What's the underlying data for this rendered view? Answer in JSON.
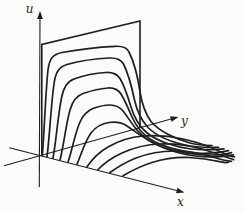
{
  "figure": {
    "description_label": "3D sketch of a solution surface u(x,y) drawn as a family of profile curves with a vertical boundary wall",
    "canvas": {
      "width": 245,
      "height": 213,
      "background": "#fbfbf9"
    },
    "ink_color": "#1f1f1f",
    "axes": {
      "u": {
        "label": "u",
        "x1": 39.3,
        "y1": 187,
        "x2": 40,
        "y2": 13,
        "tip_x": 40,
        "tip_y": 11,
        "tip_angle": -90,
        "label_x": 29.5,
        "label_y": 13
      },
      "y": {
        "label": "y",
        "x1": 4,
        "y1": 165.8,
        "x2": 175.5,
        "y2": 117.7,
        "tip_x": 178.5,
        "tip_y": 116.9,
        "tip_angle": -15.7,
        "label_x": 184.5,
        "label_y": 124.5
      },
      "x": {
        "label": "x",
        "x1": 9.3,
        "y1": 147.7,
        "x2": 181.5,
        "y2": 191.8,
        "tip_x": 184.5,
        "tip_y": 192.5,
        "tip_angle": 14.3,
        "label_x": 180.5,
        "label_y": 206
      }
    },
    "wall": {
      "name": "boundary-plane",
      "path": "M41.8,155 L41.8,44.5 L140,21 L140,127.6"
    },
    "curves": [
      {
        "name": "profile-1",
        "d": "M42.3,155.5 C44.5,130 45.5,92 48,70 C49.5,58 53,54.5 62,52.5 C78,49.5 100,47 115,46.3 C123,45.9 127,47.5 129,52 C134,62 138,78 140,92 C142,104 145.5,114 151,121.5 C159,131 175,139 190,143 C198,145 206,145.3 212,145.5"
      },
      {
        "name": "profile-2",
        "d": "M47,156.7 C49.5,138 51,105 54,84 C55.5,72 59,67 67,64.5 C81,60.5 98,58.5 110,58 C117,57.8 121,59.5 123.5,64 C128,73 132,88 134.5,100 C137,111 141,120 148,127.5 C157,136.5 174,143 190,146 C200,147.8 211,147.5 218.5,147.3"
      },
      {
        "name": "profile-3",
        "d": "M53,158.2 C56,142 58,115 61.5,98 C63.5,87 67,81.5 74,79 C85,75 97,73 106,72.5 C113,72.2 117,74 120,78.5 C124.5,86 128,97 131,107 C134,117 139,126 146.5,132.5 C156,140.5 174,147 191,149 C203,150.3 215,149.5 224,148.8"
      },
      {
        "name": "profile-4",
        "d": "M60,160 C63.5,147 66,124 70,110 C72.5,101 76,96 83,93.5 C92,90.5 101,88.5 108,88 C114,87.7 118,89.5 121,94 C125,100.5 128.5,109 132,117 C136,126 142,133.5 150,139 C161,146 180,151.5 197,153 C209,154 221,152 228.5,150.6"
      },
      {
        "name": "profile-5",
        "d": "M68,162 C72,151 75,133 80,122 C83,115 87,111 93,108.5 C99,106.2 105,105 110,105 C116,105 120,107 123.5,111.5 C128,117.5 132,124 137,130 C143,137 151,142.5 161,146.5 C175,152 196,155 211,155 C219,155 227,154 231.5,152.6"
      },
      {
        "name": "profile-6",
        "d": "M77,164.2 C81,155 85,141 91,133 C96,126.5 102,123.5 109,122.5 C116,121.5 122,122.5 127,126 C133,130 140,135.5 148,140 C158,146 172,151.5 186,154.5 C200,157.5 220,157.5 233.5,154.8"
      },
      {
        "name": "profile-7",
        "d": "M87,166.8 C92,159.5 99,152 108,147 C119,140.5 131,137 143,136 C156,135 170,136 183,139 C197,142 212,147.5 221,152 C227,155 231.5,156.5 234.5,157"
      },
      {
        "name": "profile-8",
        "d": "M98,169.5 C104,163.5 112,157.5 122,153 C134,147.5 147,144.5 160,144 C174,143.5 189,145.5 202,149 C213,152 222,156 233.8,159.8"
      },
      {
        "name": "profile-9",
        "d": "M110,172.5 C117,167.5 126,162 136,158 C148,153.5 161,151 174,151 C187,151 200,153 211,156.5 C219,159 226,161 231.5,161.3"
      },
      {
        "name": "profile-10",
        "d": "M123,175.8 C131,171 141,166 152,162.5 C164,158.7 177,157 189,157.5 C201,158 213,160 221,161.8 C224.5,162.6 227,162.7 228.5,162.3"
      }
    ],
    "stroke": {
      "curve_width": 1.7,
      "wall_width": 1.6,
      "axis_width": 1.1
    },
    "arrowhead": {
      "points": "0,0 -8,-2.9 -8,2.9"
    }
  }
}
